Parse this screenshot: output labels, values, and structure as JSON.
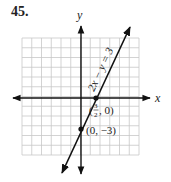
{
  "problem_number": "45.",
  "chart_data": {
    "type": "line",
    "title": "",
    "equation": "2x − y = 3",
    "xlabel": "x",
    "ylabel": "y",
    "xlim": [
      -6,
      6
    ],
    "ylim": [
      -6,
      6
    ],
    "grid": true,
    "series": [
      {
        "name": "2x − y = 3",
        "x": [
          -1.5,
          4.5
        ],
        "y": [
          -6,
          6
        ]
      }
    ],
    "points": [
      {
        "x": 1.5,
        "y": 0,
        "label": "(3/2, 0)"
      },
      {
        "x": 0,
        "y": -3,
        "label": "(0, −3)"
      }
    ]
  },
  "labels": {
    "x_axis": "x",
    "y_axis": "y",
    "equation": "2x − y = 3",
    "point1_open": "(",
    "point1_num": "3",
    "point1_den": "2",
    "point1_close": ", 0)",
    "point2": "(0, −3)"
  },
  "colors": {
    "grid": "#c8c8c8",
    "axis": "#111111",
    "line": "#111111"
  }
}
